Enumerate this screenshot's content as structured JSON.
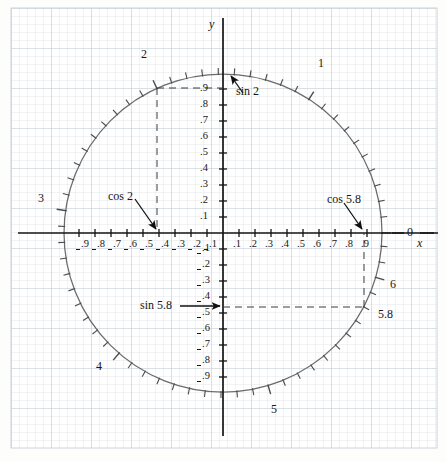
{
  "figure": {
    "type": "unit-circle-diagram",
    "axis_labels": {
      "x": "x",
      "y": "y"
    },
    "colors": {
      "grid_fine": "#d9dfe3",
      "grid_bold": "#c2cbd1",
      "ink": "#161616",
      "circle": "#5c5c5c"
    }
  },
  "chart_data": {
    "type": "scatter",
    "title": "",
    "xlabel": "x",
    "ylabel": "y",
    "xlim": [
      -1.05,
      1.05
    ],
    "ylim": [
      -1.05,
      1.05
    ],
    "grid": true,
    "curve": {
      "name": "unit circle",
      "radius": 1,
      "center": [
        0,
        0
      ]
    },
    "tick_spacing_radians": 0.1,
    "angle_labels": [
      {
        "label": "0",
        "radians": 0.0
      },
      {
        "label": "1",
        "radians": 1.0
      },
      {
        "label": "2",
        "radians": 2.0
      },
      {
        "label": "3",
        "radians": 3.0
      },
      {
        "label": "4",
        "radians": 4.0
      },
      {
        "label": "5",
        "radians": 5.0
      },
      {
        "label": "5.8",
        "radians": 5.8
      },
      {
        "label": "6",
        "radians": 6.0
      }
    ],
    "annotations": [
      {
        "label": "sin 2",
        "value": 0.909,
        "axis": "y",
        "kind": "arrow"
      },
      {
        "label": "cos 2",
        "value": -0.416,
        "axis": "x",
        "kind": "arrow"
      },
      {
        "label": "sin 5.8",
        "value": -0.465,
        "axis": "y",
        "kind": "arrow"
      },
      {
        "label": "cos 5.8",
        "value": 0.886,
        "axis": "x",
        "kind": "arrow"
      }
    ],
    "dashed_guides": [
      {
        "from_angle": 2.0,
        "to": "y-axis at .9 and x-axis at -.4"
      },
      {
        "from_angle": 5.8,
        "to": "y-axis at -.5 and x-axis at .9"
      }
    ],
    "x_tick_labels_negative": [
      "-.9",
      "-.8",
      "-.7",
      "-.6",
      "-.5",
      "-.4",
      "-.3",
      "-.2",
      "-.1"
    ],
    "x_tick_labels_positive": [
      ".1",
      ".2",
      ".3",
      ".4",
      ".5",
      ".6",
      ".7",
      ".8",
      ".9"
    ],
    "y_tick_labels_positive": [
      ".1",
      ".2",
      ".3",
      ".4",
      ".5",
      ".6",
      ".7",
      ".8",
      ".9"
    ],
    "y_tick_labels_negative": [
      "-.1",
      "-.2",
      "-.3",
      "-.4",
      "-.5",
      "-.6",
      "-.7",
      "-.8",
      "-.9"
    ]
  },
  "ticks": {
    "x_neg": [
      {
        "t": "9",
        "px": 80
      },
      {
        "t": "8",
        "px": 96
      },
      {
        "t": "7",
        "px": 112
      },
      {
        "t": "6",
        "px": 128
      },
      {
        "t": "5",
        "px": 144
      },
      {
        "t": "4",
        "px": 160
      },
      {
        "t": "3",
        "px": 176
      },
      {
        "t": "2",
        "px": 192
      },
      {
        "t": "1",
        "px": 208
      }
    ],
    "x_pos": [
      {
        "t": ".1",
        "px": 238
      },
      {
        "t": ".2",
        "px": 254
      },
      {
        "t": ".3",
        "px": 270
      },
      {
        "t": ".4",
        "px": 286
      },
      {
        "t": ".5",
        "px": 302
      },
      {
        "t": ".6",
        "px": 318
      },
      {
        "t": ".7",
        "px": 334
      },
      {
        "t": ".8",
        "px": 350
      },
      {
        "t": ".9",
        "px": 366
      }
    ],
    "y_pos": [
      {
        "t": ".1",
        "px": 217
      },
      {
        "t": ".2",
        "px": 201
      },
      {
        "t": ".3",
        "px": 185
      },
      {
        "t": ".4",
        "px": 169
      },
      {
        "t": ".5",
        "px": 153
      },
      {
        "t": ".6",
        "px": 137
      },
      {
        "t": ".7",
        "px": 121
      },
      {
        "t": ".8",
        "px": 105
      },
      {
        "t": ".9",
        "px": 89
      }
    ],
    "y_neg": [
      {
        "t": "1",
        "px": 249
      },
      {
        "t": "2",
        "px": 265
      },
      {
        "t": "3",
        "px": 281
      },
      {
        "t": "4",
        "px": 297
      },
      {
        "t": "5",
        "px": 313
      },
      {
        "t": "6",
        "px": 329
      },
      {
        "t": "7",
        "px": 345
      },
      {
        "t": "8",
        "px": 361
      },
      {
        "t": "9",
        "px": 377
      }
    ]
  },
  "labels": {
    "angle0": "0",
    "angle1": "1",
    "angle2": "2",
    "angle3": "3",
    "angle4": "4",
    "angle5": "5",
    "angle6": "6",
    "angle58": "5.8",
    "sin2": "sin 2",
    "cos2": "cos 2",
    "sin58": "sin 5.8",
    "cos58": "cos 5.8",
    "x_axis": "x",
    "y_axis": "y"
  }
}
